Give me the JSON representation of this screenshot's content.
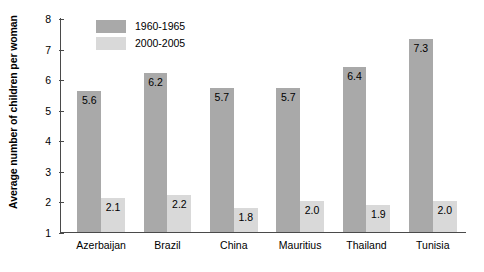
{
  "chart_data": {
    "type": "bar",
    "title": "",
    "xlabel": "",
    "ylabel": "Average number of children per woman",
    "categories": [
      "Azerbaijan",
      "Brazil",
      "China",
      "Mauritius",
      "Thailand",
      "Tunisia"
    ],
    "series": [
      {
        "name": "1960-1965",
        "color": "#a9a9a9",
        "values": [
          5.6,
          6.2,
          5.7,
          5.7,
          6.4,
          7.3
        ],
        "labels": [
          "5.6",
          "6.2",
          "5.7",
          "5.7",
          "6.4",
          "7.3"
        ]
      },
      {
        "name": "2000-2005",
        "color": "#d9d9d9",
        "values": [
          2.1,
          2.2,
          1.8,
          2.0,
          1.9,
          2.0
        ],
        "labels": [
          "2.1",
          "2.2",
          "1.8",
          "2.0",
          "1.9",
          "2.0"
        ]
      }
    ],
    "ylim": [
      1,
      8
    ],
    "yticks": [
      1,
      2,
      3,
      4,
      5,
      6,
      7,
      8
    ],
    "ytick_labels": [
      "1",
      "2",
      "3",
      "4",
      "5",
      "6",
      "7",
      "8"
    ],
    "grid": false,
    "legend_position": "top-left-inside",
    "axis_color": "#4a4a4a",
    "background": "#ffffff"
  }
}
